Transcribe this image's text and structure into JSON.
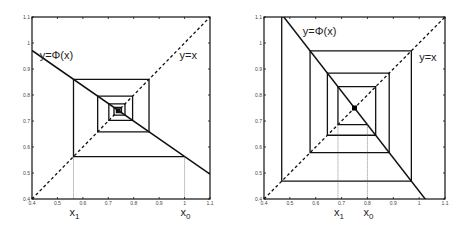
{
  "chart_data": [
    {
      "type": "line",
      "title": "",
      "description": "Cobweb diagram, convergent iteration",
      "xlim": [
        0.4,
        1.1
      ],
      "ylim": [
        0.4,
        1.1
      ],
      "xticks": [
        "0.4",
        "0.5",
        "0.6",
        "0.7",
        "0.8",
        "0.9",
        "1",
        "1.1"
      ],
      "yticks": [
        "0.4",
        "0.5",
        "0.6",
        "0.7",
        "0.8",
        "0.9",
        "1",
        "1.1"
      ],
      "grid": false,
      "fixed_point": 0.74,
      "slope": -0.68,
      "x0": 1.0,
      "iterations": 14,
      "series": [
        {
          "name": "y=Φ(x)",
          "style": "solid",
          "x": [
            0.4,
            1.1
          ],
          "y": [
            0.971,
            0.495
          ]
        },
        {
          "name": "y=x",
          "style": "dashed",
          "x": [
            0.4,
            1.1
          ],
          "y": [
            0.4,
            1.1
          ]
        }
      ],
      "annotations": [
        {
          "text": "y=Φ(x)",
          "x": 0.43,
          "y": 0.94
        },
        {
          "text": "y=x",
          "x": 0.98,
          "y": 0.94
        },
        {
          "text": "x",
          "sub": "1",
          "at": "x1"
        },
        {
          "text": "x",
          "sub": "0",
          "at": "x0"
        }
      ],
      "show_fixed_point": false
    },
    {
      "type": "line",
      "title": "",
      "description": "Cobweb diagram, divergent iteration",
      "xlim": [
        0.4,
        1.1
      ],
      "ylim": [
        0.4,
        1.1
      ],
      "xticks": [
        "0.4",
        "0.5",
        "0.6",
        "0.7",
        "0.8",
        "0.9",
        "1",
        "1.1"
      ],
      "yticks": [
        "0.4",
        "0.5",
        "0.6",
        "0.7",
        "0.8",
        "0.9",
        "1",
        "1.1"
      ],
      "grid": false,
      "fixed_point": 0.75,
      "slope": -1.28,
      "x0": 0.8,
      "iterations": 7,
      "series": [
        {
          "name": "y=Φ(x)",
          "style": "solid",
          "x": [
            0.4,
            1.1
          ],
          "y": [
            1.19,
            0.294
          ]
        },
        {
          "name": "y=x",
          "style": "dashed",
          "x": [
            0.4,
            1.1
          ],
          "y": [
            0.4,
            1.1
          ]
        }
      ],
      "annotations": [
        {
          "text": "y=Φ(x)",
          "x": 0.55,
          "y": 1.03
        },
        {
          "text": "y=x",
          "x": 1.0,
          "y": 0.93
        },
        {
          "text": "x",
          "sub": "1",
          "at": "x1"
        },
        {
          "text": "x",
          "sub": "0",
          "at": "x0"
        }
      ],
      "show_fixed_point": true
    }
  ]
}
